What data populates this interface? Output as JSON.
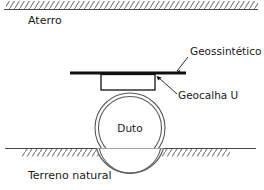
{
  "diagram": {
    "labels": {
      "fill_layer": "Aterro",
      "pipe": "Duto",
      "natural_ground": "Terreno natural",
      "geosynthetic": "Geossintético",
      "geotrough": "Geocalha U"
    },
    "colors": {
      "background": "#ffffff",
      "line": "#4a4a4a",
      "bar": "#111111",
      "pipe_stroke": "#5a5a5a",
      "text": "#1a1a1a",
      "hatch": "#7a7a7a"
    },
    "elements": {
      "top_ground_line": {
        "x1": 4,
        "y1": 9,
        "x2": 258,
        "y2": 9
      },
      "top_hatch_band": {
        "x": 6,
        "y": 1,
        "width": 252,
        "height": 8
      },
      "bottom_ground_line": {
        "x1": 5,
        "y1": 148,
        "x2": 256,
        "y2": 148
      },
      "bottom_hatch_band": {
        "x": 22,
        "y": 148,
        "width": 208,
        "height": 8
      },
      "geosynthetic_bar": {
        "x1": 70,
        "y1": 73,
        "x2": 186,
        "y2": 73
      },
      "geotrough_rect": {
        "x": 101,
        "y": 74,
        "width": 54,
        "height": 16
      },
      "pipe_outer_circle": {
        "cx": 130,
        "cy": 128,
        "r": 35
      },
      "pipe_inner_circle": {
        "cx": 130,
        "cy": 128,
        "r": 31.5
      }
    },
    "leaders": [
      {
        "name": "geosynthetic-leader",
        "from_x": 189,
        "from_y": 56,
        "to_x": 178,
        "to_y": 72
      },
      {
        "name": "geotrough-leader",
        "from_x": 178,
        "from_y": 95,
        "to_x": 157,
        "to_y": 77
      }
    ],
    "text_positions": {
      "fill_layer": {
        "x": 28,
        "y": 22
      },
      "geosynthetic": {
        "x": 190,
        "y": 56
      },
      "geotrough": {
        "x": 176,
        "y": 99
      },
      "pipe": {
        "x": 130,
        "y": 132
      },
      "natural_ground": {
        "x": 28,
        "y": 176
      }
    }
  }
}
